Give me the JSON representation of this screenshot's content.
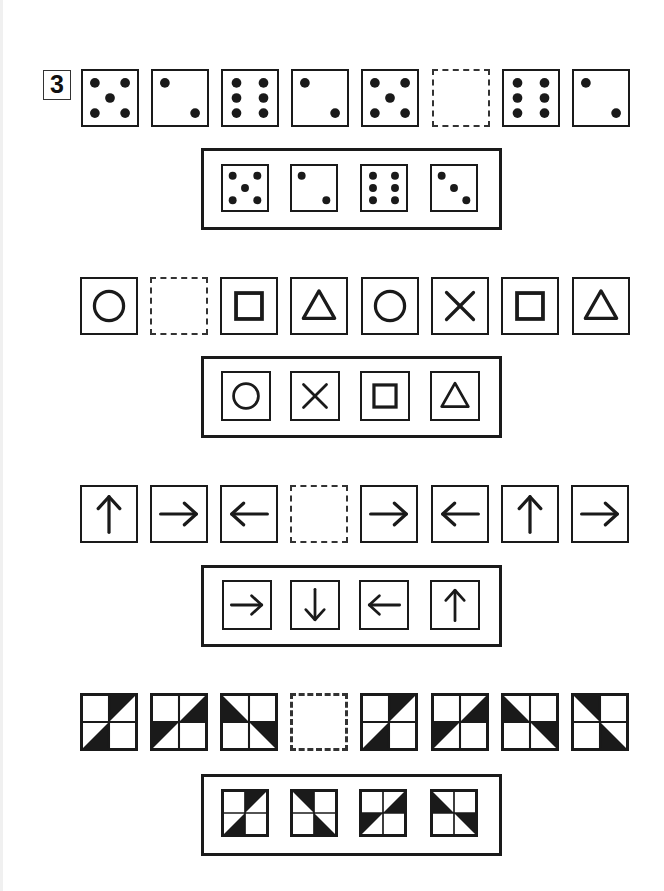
{
  "page": {
    "problem_number": "3",
    "background": "#ffffff",
    "ink": "#1a1a1a"
  },
  "rows": [
    {
      "name": "dice",
      "sequence": [
        "die-5",
        "die-2",
        "die-6",
        "die-2",
        "die-5",
        "blank",
        "die-6",
        "die-2"
      ],
      "answer_choices": [
        "die-5",
        "die-2",
        "die-6",
        "die-3"
      ]
    },
    {
      "name": "shapes",
      "sequence": [
        "circle",
        "blank",
        "square",
        "triangle",
        "circle",
        "cross",
        "square",
        "triangle"
      ],
      "answer_choices": [
        "circle",
        "cross",
        "square",
        "triangle"
      ]
    },
    {
      "name": "arrows",
      "sequence": [
        "arrow-up",
        "arrow-right",
        "arrow-left",
        "blank",
        "arrow-right",
        "arrow-left",
        "arrow-up",
        "arrow-right"
      ],
      "answer_choices": [
        "arrow-right",
        "arrow-down",
        "arrow-left",
        "arrow-up"
      ]
    },
    {
      "name": "pinwheel-tiles",
      "sequence": [
        "tile-a",
        "tile-b",
        "tile-c",
        "blank",
        "tile-a",
        "tile-b",
        "tile-c",
        "tile-d"
      ],
      "answer_choices": [
        "tile-a",
        "tile-d",
        "tile-b",
        "tile-c"
      ]
    }
  ]
}
